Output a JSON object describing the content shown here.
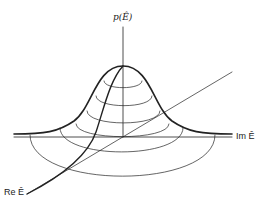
{
  "diagram": {
    "type": "3d-surface-sketch",
    "labels": {
      "vertical_axis": "p(Ê)",
      "horizontal_axis": "Im Ê",
      "depth_axis": "Re Ê"
    },
    "stroke_color": "#222222",
    "background": "#ffffff"
  }
}
